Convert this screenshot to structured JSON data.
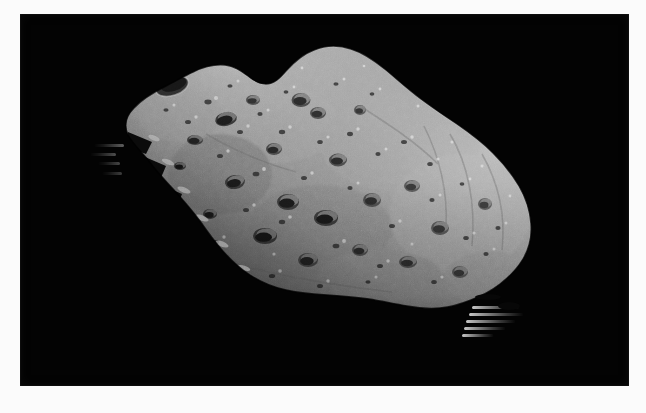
{
  "page": {
    "width": 646,
    "height": 413,
    "margin_color": "#fbfbfb",
    "plate_color": "#030303",
    "alt_text": "Grayscale spacecraft photograph of an irregular, heavily cratered asteroid against black space"
  },
  "photo": {
    "subject": "asteroid",
    "background": "black space",
    "palette": {
      "space_black": "#030303",
      "terminator_shadow": "#101010",
      "surface_dark": "#4e4e4e",
      "surface_mid": "#8a8a8a",
      "surface_light": "#a9a9a9",
      "surface_highlight": "#cfcfcf",
      "crater_shadow": "#2a2a2a",
      "border_white": "#fbfbfb"
    },
    "lighting": {
      "illumination_direction": "upper-right",
      "terminator_edge": "lower-left"
    },
    "bounds": {
      "plate_left": 20,
      "plate_top": 14,
      "plate_width": 609,
      "plate_height": 372
    },
    "features": {
      "shape": "elongated irregular potato",
      "peak_label": "upper-left ridge peak",
      "large_crater_label": "large dark crater near upper-left peak",
      "artifact_label": "horizontal scan-line finger artifacts at lower-right limb"
    }
  },
  "asteroid_body": {
    "outline_path": "M 108 121 C 104 112, 106 102, 114 94 C 122 85, 134 78, 146 72 C 156 67, 164 62, 173 58 C 183 53, 194 50, 205 51 C 214 52, 221 57, 228 62 C 234 67, 239 70, 246 70 C 254 70, 260 64, 266 57 C 274 48, 283 40, 294 36 C 306 31, 319 31, 331 35 C 344 39, 355 47, 366 56 C 378 66, 389 76, 401 85 C 413 94, 425 102, 437 110 C 450 119, 462 128, 473 139 C 483 149, 492 160, 499 172 C 506 184, 510 197, 511 210 C 512 223, 509 235, 503 245 C 497 255, 489 263, 480 270 C 471 277, 461 282, 451 286 C 441 290, 431 293, 420 294 C 409 295, 398 294, 387 292 C 374 290, 362 287, 349 285 C 335 283, 321 282, 307 281 C 293 280, 279 279, 266 276 C 253 273, 241 268, 230 261 C 219 254, 210 245, 202 236 C 194 227, 187 217, 180 207 C 172 196, 163 186, 154 176 C 145 166, 136 157, 129 147 C 121 137, 113 130, 108 121 Z",
    "craters": [
      {
        "cx": 152,
        "cy": 72,
        "rx": 17,
        "ry": 9,
        "rot": -18,
        "depth": "deep"
      },
      {
        "cx": 206,
        "cy": 105,
        "rx": 11,
        "ry": 7,
        "rot": -12,
        "depth": "deep"
      },
      {
        "cx": 175,
        "cy": 126,
        "rx": 8,
        "ry": 5,
        "rot": -10,
        "depth": "medium"
      },
      {
        "cx": 233,
        "cy": 86,
        "rx": 7,
        "ry": 5,
        "rot": 0,
        "depth": "shallow"
      },
      {
        "cx": 281,
        "cy": 86,
        "rx": 9,
        "ry": 7,
        "rot": 0,
        "depth": "medium"
      },
      {
        "cx": 298,
        "cy": 99,
        "rx": 8,
        "ry": 6,
        "rot": 0,
        "depth": "shallow"
      },
      {
        "cx": 340,
        "cy": 96,
        "rx": 6,
        "ry": 5,
        "rot": 0,
        "depth": "shallow"
      },
      {
        "cx": 254,
        "cy": 135,
        "rx": 8,
        "ry": 6,
        "rot": 0,
        "depth": "medium"
      },
      {
        "cx": 318,
        "cy": 146,
        "rx": 9,
        "ry": 6,
        "rot": 0,
        "depth": "medium"
      },
      {
        "cx": 215,
        "cy": 168,
        "rx": 10,
        "ry": 7,
        "rot": -8,
        "depth": "deep"
      },
      {
        "cx": 268,
        "cy": 188,
        "rx": 11,
        "ry": 8,
        "rot": 0,
        "depth": "deep"
      },
      {
        "cx": 306,
        "cy": 204,
        "rx": 12,
        "ry": 8,
        "rot": 0,
        "depth": "deep"
      },
      {
        "cx": 352,
        "cy": 186,
        "rx": 9,
        "ry": 7,
        "rot": 0,
        "depth": "medium"
      },
      {
        "cx": 392,
        "cy": 172,
        "rx": 8,
        "ry": 6,
        "rot": 0,
        "depth": "shallow"
      },
      {
        "cx": 420,
        "cy": 214,
        "rx": 9,
        "ry": 7,
        "rot": 0,
        "depth": "medium"
      },
      {
        "cx": 245,
        "cy": 222,
        "rx": 12,
        "ry": 8,
        "rot": 0,
        "depth": "deep"
      },
      {
        "cx": 288,
        "cy": 246,
        "rx": 10,
        "ry": 7,
        "rot": 0,
        "depth": "medium"
      },
      {
        "cx": 340,
        "cy": 236,
        "rx": 8,
        "ry": 6,
        "rot": 0,
        "depth": "shallow"
      },
      {
        "cx": 388,
        "cy": 248,
        "rx": 9,
        "ry": 6,
        "rot": 0,
        "depth": "medium"
      },
      {
        "cx": 440,
        "cy": 258,
        "rx": 8,
        "ry": 6,
        "rot": 0,
        "depth": "shallow"
      },
      {
        "cx": 465,
        "cy": 190,
        "rx": 7,
        "ry": 6,
        "rot": 0,
        "depth": "shallow"
      },
      {
        "cx": 190,
        "cy": 200,
        "rx": 7,
        "ry": 5,
        "rot": 0,
        "depth": "medium"
      },
      {
        "cx": 160,
        "cy": 152,
        "rx": 6,
        "ry": 4,
        "rot": 0,
        "depth": "medium"
      }
    ],
    "artifact_fingers": [
      {
        "x": 455,
        "y": 292,
        "w": 46,
        "h": 3
      },
      {
        "x": 452,
        "y": 299,
        "w": 52,
        "h": 3
      },
      {
        "x": 448,
        "y": 306,
        "w": 48,
        "h": 3
      },
      {
        "x": 446,
        "y": 313,
        "w": 40,
        "h": 3
      },
      {
        "x": 444,
        "y": 320,
        "w": 30,
        "h": 3
      }
    ],
    "artifact_fingers_left": [
      {
        "x": 74,
        "y": 130,
        "w": 30,
        "h": 3
      },
      {
        "x": 70,
        "y": 139,
        "w": 26,
        "h": 3
      },
      {
        "x": 78,
        "y": 148,
        "w": 22,
        "h": 3
      },
      {
        "x": 82,
        "y": 158,
        "w": 20,
        "h": 3
      }
    ]
  }
}
